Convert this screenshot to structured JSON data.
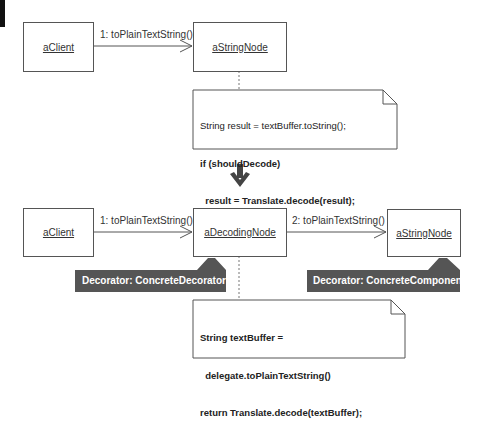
{
  "before": {
    "objects": {
      "client": "aClient",
      "string_node": "aStringNode"
    },
    "message": "1: toPlainTextString()",
    "note": {
      "lines": [
        {
          "text": "String result = textBuffer.toString();",
          "bold": false
        },
        {
          "text": "if (shouldDecode)",
          "bold": true
        },
        {
          "text": "  result = Translate.decode(result);",
          "bold": true
        },
        {
          "text": "return result;",
          "bold": false
        }
      ]
    }
  },
  "transition": {
    "icon": "down-arrow-icon"
  },
  "after": {
    "objects": {
      "client": "aClient",
      "decoding_node": "aDecodingNode",
      "string_node": "aStringNode"
    },
    "messages": {
      "first": "1: toPlainTextString()",
      "second": "2: toPlainTextString()"
    },
    "tags": {
      "decorator": "Decorator: ConcreteDecorator",
      "component": "Decorator: ConcreteComponent"
    },
    "note": {
      "lines": [
        {
          "text": "String textBuffer =",
          "bold": true
        },
        {
          "text": "  delegate.toPlainTextString()",
          "bold": true
        },
        {
          "text": "return Translate.decode(textBuffer);",
          "bold": true
        }
      ]
    }
  },
  "colors": {
    "tag_fill": "#555555",
    "line": "#555555",
    "corner_bar": "#111111"
  }
}
